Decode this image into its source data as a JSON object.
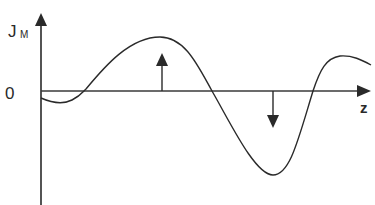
{
  "diagram": {
    "y_axis_label": "J",
    "y_axis_subscript": "M",
    "origin_label": "0",
    "x_axis_label": "z",
    "colors": {
      "line": "#2a2a2a",
      "background": "#ffffff"
    },
    "curve_description": "Smooth oscillating curve: small negative dip near origin, crosses zero, positive peak, crosses zero, deeper negative trough, crosses zero and rises to a positive plateau",
    "arrows": [
      {
        "direction": "up",
        "position": "under positive peak"
      },
      {
        "direction": "down",
        "position": "above negative trough"
      }
    ]
  }
}
